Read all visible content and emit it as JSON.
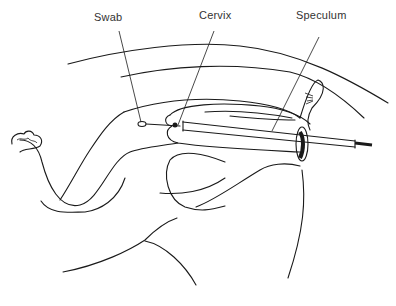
{
  "diagram": {
    "type": "anatomical line illustration",
    "labels": [
      {
        "id": "swab",
        "text": "Swab"
      },
      {
        "id": "cervix",
        "text": "Cervix"
      },
      {
        "id": "speculum",
        "text": "Speculum"
      }
    ],
    "colors": {
      "line": "#1a1a1a",
      "label": "#333333",
      "background": "#ffffff"
    }
  }
}
